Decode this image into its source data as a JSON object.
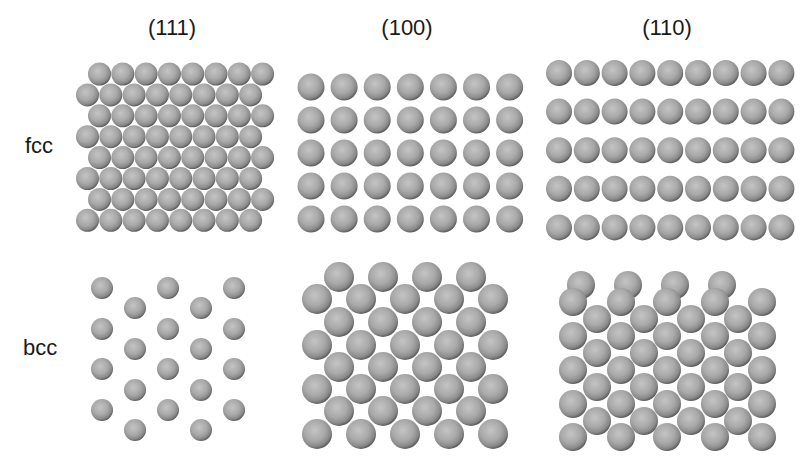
{
  "figure": {
    "column_labels": [
      {
        "text": "(111)",
        "x": 172,
        "y": 27
      },
      {
        "text": "(100)",
        "x": 407,
        "y": 27
      },
      {
        "text": "(110)",
        "x": 667,
        "y": 27
      }
    ],
    "row_labels": [
      {
        "text": "fcc",
        "x": 25,
        "y": 146
      },
      {
        "text": "bcc",
        "x": 23,
        "y": 348
      }
    ],
    "atom_color": "#a8a8a8",
    "panels": [
      {
        "id": "fcc-111",
        "label": "fcc (111)",
        "diameter": 23,
        "lattice": "hexagonal close-packed",
        "rows": 8,
        "atoms_per_row": 8
      },
      {
        "id": "fcc-100",
        "label": "fcc (100)",
        "diameter": 27,
        "lattice": "square",
        "rows": 5,
        "atoms_per_row": 7
      },
      {
        "id": "fcc-110",
        "label": "fcc (110)",
        "diameter": 26,
        "lattice": "rectangular rows",
        "rows": 5,
        "atoms_per_row": 9
      },
      {
        "id": "bcc-111",
        "label": "bcc (111)",
        "diameter": 22,
        "lattice": "open centered-rectangular",
        "atom_count": 20
      },
      {
        "id": "bcc-100",
        "label": "bcc (100)",
        "diameter": 30,
        "lattice": "centered square",
        "atom_count": 36
      },
      {
        "id": "bcc-110",
        "label": "bcc (110)",
        "diameter": 28,
        "lattice": "centered rectangular",
        "atom_count": 45
      }
    ]
  }
}
